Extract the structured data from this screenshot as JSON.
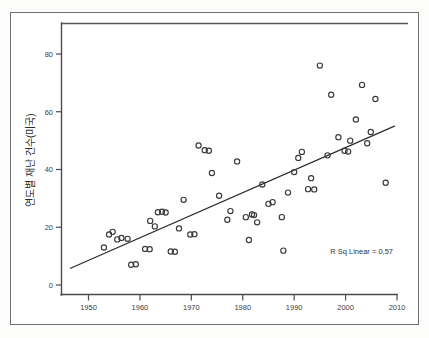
{
  "figure": {
    "name": "disaster-count-scatter",
    "background_color": "#ffffff",
    "frame_color": "#6e6e6e",
    "axis_color": "#4a4a4a",
    "marker_color": "#3a3a3a",
    "line_color": "#2e2e2e"
  },
  "chart_data": {
    "type": "scatter",
    "title": "",
    "subtitle": "",
    "xlabel": "",
    "ylabel": "연도별 재난 건수(미국)",
    "xlim": [
      1946,
      2011
    ],
    "ylim": [
      -2,
      86
    ],
    "xticks": [
      1950,
      1960,
      1970,
      1980,
      1990,
      2000,
      2010
    ],
    "xticklabels": [
      "1950",
      "1960",
      "1970",
      "1980",
      "1990",
      "2000",
      "2010"
    ],
    "yticks": [
      0,
      20,
      40,
      60,
      80
    ],
    "yticklabels": [
      "0",
      "20",
      "40",
      "60",
      "80"
    ],
    "grid": false,
    "legend": null,
    "legend_position": "none",
    "annotations": [
      {
        "name": "r-squared-annotation",
        "text": "R Sq Linear = 0,57",
        "x": 2006,
        "y": 9
      }
    ],
    "fit_line": {
      "name": "linear-trend-line",
      "type": "linear",
      "r_squared": 0.57,
      "x_start": 1946.5,
      "y_start": 5.8,
      "x_end": 2009.5,
      "y_end": 55.0
    },
    "series": [
      {
        "name": "연도별 재난 건수(미국)",
        "marker": "open-circle",
        "points": [
          [
            1953,
            13.0
          ],
          [
            1954,
            17.5
          ],
          [
            1954.7,
            18.4
          ],
          [
            1955.6,
            15.8
          ],
          [
            1956.4,
            16.3
          ],
          [
            1957.6,
            16.0
          ],
          [
            1958.3,
            7.0
          ],
          [
            1959.2,
            7.2
          ],
          [
            1961.0,
            12.5
          ],
          [
            1961.9,
            12.4
          ],
          [
            1962.0,
            22.2
          ],
          [
            1962.9,
            20.3
          ],
          [
            1963.5,
            25.2
          ],
          [
            1964.3,
            25.4
          ],
          [
            1965.0,
            25.1
          ],
          [
            1966.0,
            11.6
          ],
          [
            1966.8,
            11.5
          ],
          [
            1967.6,
            19.6
          ],
          [
            1968.5,
            29.5
          ],
          [
            1969.8,
            17.5
          ],
          [
            1970.6,
            17.6
          ],
          [
            1971.4,
            48.3
          ],
          [
            1972.6,
            46.7
          ],
          [
            1973.4,
            46.5
          ],
          [
            1974.0,
            38.8
          ],
          [
            1975.4,
            30.9
          ],
          [
            1977.0,
            22.6
          ],
          [
            1977.6,
            25.6
          ],
          [
            1978.9,
            42.8
          ],
          [
            1980.6,
            23.5
          ],
          [
            1981.2,
            15.6
          ],
          [
            1981.8,
            24.4
          ],
          [
            1982.2,
            24.2
          ],
          [
            1982.8,
            21.7
          ],
          [
            1983.8,
            34.8
          ],
          [
            1985.0,
            28.1
          ],
          [
            1985.8,
            28.7
          ],
          [
            1987.6,
            23.5
          ],
          [
            1987.9,
            11.9
          ],
          [
            1988.8,
            32.0
          ],
          [
            1990.0,
            39.1
          ],
          [
            1990.8,
            44.0
          ],
          [
            1991.5,
            46.1
          ],
          [
            1992.7,
            33.2
          ],
          [
            1993.3,
            37.0
          ],
          [
            1993.9,
            33.1
          ],
          [
            1995.0,
            76.0
          ],
          [
            1996.5,
            44.9
          ],
          [
            1997.2,
            65.9
          ],
          [
            1998.6,
            51.2
          ],
          [
            1999.8,
            46.5
          ],
          [
            2000.5,
            46.2
          ],
          [
            2000.9,
            50.0
          ],
          [
            2002.0,
            57.3
          ],
          [
            2003.2,
            69.3
          ],
          [
            2004.2,
            49.1
          ],
          [
            2004.9,
            53.0
          ],
          [
            2005.8,
            64.4
          ],
          [
            2007.8,
            35.4
          ]
        ]
      }
    ]
  }
}
